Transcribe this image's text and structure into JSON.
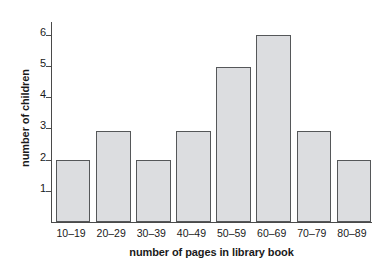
{
  "chart_data": {
    "type": "bar",
    "title": "",
    "subtitle": "",
    "xlabel": "number of pages in library book",
    "ylabel": "number of children",
    "categories": [
      "10–19",
      "20–29",
      "30–39",
      "40–49",
      "50–59",
      "60–69",
      "70–79",
      "80–89"
    ],
    "values": [
      2,
      2.9,
      2,
      2.9,
      4.95,
      6,
      2.9,
      2
    ],
    "ylim": [
      0,
      6.4
    ],
    "yticks": [
      1,
      2,
      3,
      4,
      5,
      6
    ],
    "ytick_labels": [
      "1",
      "2",
      "3",
      "4",
      "5",
      "6"
    ],
    "grid": false,
    "legend": null,
    "annotations": [],
    "colors": {
      "bar_fill": "#dcdde0",
      "bar_border": "#555759",
      "axis": "#4a4a4a",
      "text": "#1a1a1a",
      "background": "#ffffff"
    }
  }
}
